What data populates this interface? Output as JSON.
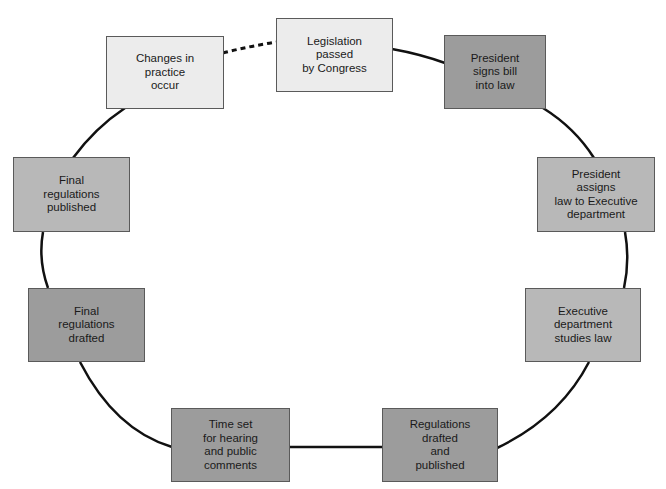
{
  "diagram": {
    "type": "cycle",
    "colors": {
      "light": "#ececec",
      "mid": "#b8b8b8",
      "dark": "#9c9c9c",
      "connector": "#111111",
      "border": "#5a5a5a"
    },
    "nodes": [
      {
        "id": "legislation",
        "label": "Legislation\npassed\nby Congress",
        "shade": "light"
      },
      {
        "id": "president-signs",
        "label": "President\nsigns bill\ninto law",
        "shade": "dark"
      },
      {
        "id": "president-assigns",
        "label": "President\nassigns\nlaw to Executive\ndepartment",
        "shade": "mid"
      },
      {
        "id": "executive-studies",
        "label": "Executive\ndepartment\nstudies law",
        "shade": "mid"
      },
      {
        "id": "regulations-drafted-published",
        "label": "Regulations\ndrafted\nand\npublished",
        "shade": "dark"
      },
      {
        "id": "time-set",
        "label": "Time set\nfor hearing\nand public\ncomments",
        "shade": "dark"
      },
      {
        "id": "final-drafted",
        "label": "Final\nregulations\ndrafted",
        "shade": "dark"
      },
      {
        "id": "final-published",
        "label": "Final\nregulations\npublished",
        "shade": "mid"
      },
      {
        "id": "changes-practice",
        "label": "Changes in\npractice\noccur",
        "shade": "light"
      }
    ],
    "edges": [
      {
        "from": "legislation",
        "to": "president-signs",
        "style": "solid"
      },
      {
        "from": "president-signs",
        "to": "president-assigns",
        "style": "solid"
      },
      {
        "from": "president-assigns",
        "to": "executive-studies",
        "style": "solid"
      },
      {
        "from": "executive-studies",
        "to": "regulations-drafted-published",
        "style": "solid"
      },
      {
        "from": "regulations-drafted-published",
        "to": "time-set",
        "style": "solid"
      },
      {
        "from": "time-set",
        "to": "final-drafted",
        "style": "solid"
      },
      {
        "from": "final-drafted",
        "to": "final-published",
        "style": "solid"
      },
      {
        "from": "final-published",
        "to": "changes-practice",
        "style": "solid"
      },
      {
        "from": "changes-practice",
        "to": "legislation",
        "style": "dashed"
      }
    ]
  }
}
